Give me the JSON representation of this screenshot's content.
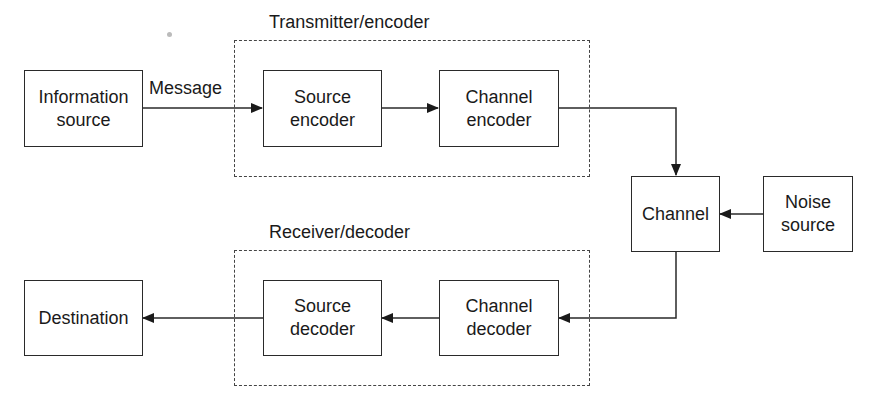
{
  "diagram": {
    "groups": [
      {
        "id": "transmitter",
        "label": "Transmitter/encoder"
      },
      {
        "id": "receiver",
        "label": "Receiver/decoder"
      }
    ],
    "blocks": {
      "information_source": {
        "line1": "Information",
        "line2": "source"
      },
      "source_encoder": {
        "line1": "Source",
        "line2": "encoder"
      },
      "channel_encoder": {
        "line1": "Channel",
        "line2": "encoder"
      },
      "channel": {
        "line1": "Channel"
      },
      "noise_source": {
        "line1": "Noise",
        "line2": "source"
      },
      "channel_decoder": {
        "line1": "Channel",
        "line2": "decoder"
      },
      "source_decoder": {
        "line1": "Source",
        "line2": "decoder"
      },
      "destination": {
        "line1": "Destination"
      }
    },
    "edge_labels": {
      "message": "Message"
    },
    "edges": [
      {
        "from": "Information source",
        "to": "Source encoder",
        "label": "Message"
      },
      {
        "from": "Source encoder",
        "to": "Channel encoder"
      },
      {
        "from": "Channel encoder",
        "to": "Channel"
      },
      {
        "from": "Noise source",
        "to": "Channel"
      },
      {
        "from": "Channel",
        "to": "Channel decoder"
      },
      {
        "from": "Channel decoder",
        "to": "Source decoder"
      },
      {
        "from": "Source decoder",
        "to": "Destination"
      }
    ]
  }
}
